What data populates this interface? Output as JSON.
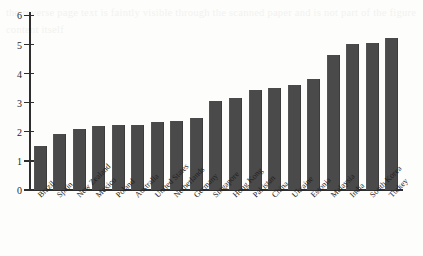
{
  "figure": {
    "background_color": "#fdfdfb",
    "bar_color": "#4a4a4a",
    "axis_color": "#2e2e2e"
  },
  "bleed_through_text": "the reverse page text is faintly visible through the scanned paper and is not part of the figure content itself",
  "chart_data": {
    "type": "bar",
    "title": "",
    "subtitle": "",
    "xlabel": "",
    "ylabel": "",
    "ylim": [
      0,
      6
    ],
    "yticks": [
      0,
      1,
      2,
      3,
      4,
      5,
      6
    ],
    "ytick_labels": [
      "0",
      "1",
      "2",
      "3",
      "4",
      "5",
      "6"
    ],
    "grid": false,
    "legend": null,
    "orientation": "vertical",
    "sorted": "ascending",
    "categories": [
      "Brazil",
      "Spain",
      "New Zealand",
      "Mexico",
      "Poland",
      "Australia",
      "United States",
      "Netherlands",
      "Germany",
      "Singapore",
      "Hong Kong",
      "Pakistan",
      "China",
      "Ukraine",
      "Estonia",
      "Malaysia",
      "India",
      "South Korea",
      "Turkey"
    ],
    "values": [
      1.52,
      1.92,
      2.1,
      2.2,
      2.25,
      2.25,
      2.33,
      2.38,
      2.47,
      3.05,
      3.15,
      3.43,
      3.5,
      3.6,
      3.8,
      4.65,
      5.02,
      5.05,
      5.22
    ]
  }
}
